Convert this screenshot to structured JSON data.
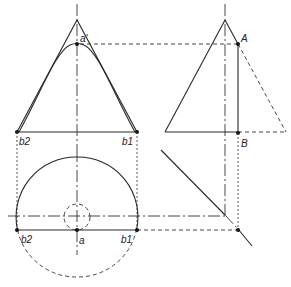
{
  "diagram": {
    "type": "descriptive-geometry construction (cone projection with section)",
    "views": [
      "front-view",
      "side-view",
      "plan-view"
    ],
    "labels": {
      "a_prime": "a'",
      "b2_top": "b2",
      "b1_top": "b1",
      "A": "A",
      "B": "B",
      "b2_bottom": "b2",
      "a_bottom": "a",
      "b1_bottom": "b1"
    },
    "colors": {
      "line": "#2a2a2a",
      "background": "#ffffff"
    }
  }
}
